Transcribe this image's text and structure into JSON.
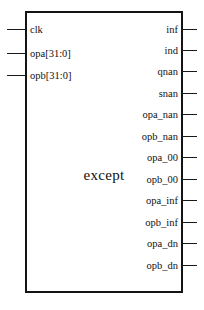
{
  "figure": {
    "module_name": "except",
    "caption_text": "",
    "border_color": "#141414",
    "pin_color": "#1a1a1a",
    "background_color": "#ffffff"
  },
  "inputs": [
    {
      "label": "clk",
      "y": 23
    },
    {
      "label": "opa[31:0]",
      "y": 47
    },
    {
      "label": "opb[31:0]",
      "y": 69
    }
  ],
  "outputs": [
    {
      "label": "inf",
      "y": 23
    },
    {
      "label": "ind",
      "y": 44
    },
    {
      "label": "qnan",
      "y": 65
    },
    {
      "label": "snan",
      "y": 87
    },
    {
      "label": "opa_nan",
      "y": 108
    },
    {
      "label": "opb_nan",
      "y": 130
    },
    {
      "label": "opa_00",
      "y": 151
    },
    {
      "label": "opb_00",
      "y": 173
    },
    {
      "label": "opa_inf",
      "y": 194
    },
    {
      "label": "opb_inf",
      "y": 216
    },
    {
      "label": "opa_dn",
      "y": 237
    },
    {
      "label": "opb_dn",
      "y": 259
    }
  ]
}
